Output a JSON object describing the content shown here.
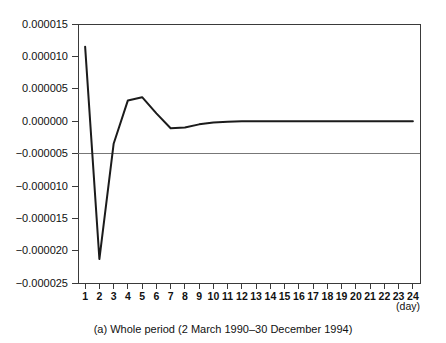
{
  "chart_data": {
    "type": "line",
    "title": "",
    "subtitle": "",
    "caption": "(a) Whole period (2 March 1990–30 December 1994)",
    "xlabel": "",
    "xunit": "(day)",
    "ylabel": "",
    "grid": false,
    "legend": false,
    "legend_position": "none",
    "xlim": [
      0.5,
      24.5
    ],
    "ylim": [
      -2.5e-05,
      1.5e-05
    ],
    "x_ticks": [
      1,
      2,
      3,
      4,
      5,
      6,
      7,
      8,
      9,
      10,
      11,
      12,
      13,
      14,
      15,
      16,
      17,
      18,
      19,
      20,
      21,
      22,
      23,
      24
    ],
    "x_tick_labels": [
      "1",
      "2",
      "3",
      "4",
      "5",
      "6",
      "7",
      "8",
      "9",
      "10",
      "11",
      "12",
      "13",
      "14",
      "15",
      "16",
      "17",
      "18",
      "19",
      "20",
      "21",
      "22",
      "23",
      "24"
    ],
    "y_ticks": [
      1.5e-05,
      1e-05,
      5e-06,
      0.0,
      -5e-06,
      -1e-05,
      -1.5e-05,
      -2e-05,
      -2.5e-05
    ],
    "y_tick_labels": [
      "0.000015",
      "0.000010",
      "0.000005",
      "0.000000",
      "−0.000005",
      "−0.000010",
      "−0.000015",
      "−0.000020",
      "−0.000025"
    ],
    "x": [
      1,
      2,
      3,
      4,
      5,
      6,
      7,
      8,
      9,
      10,
      11,
      12,
      13,
      14,
      15,
      16,
      17,
      18,
      19,
      20,
      21,
      22,
      23,
      24
    ],
    "values": [
      1.15e-05,
      -2.13e-05,
      -3.5e-06,
      3.2e-06,
      3.7e-06,
      1.2e-06,
      -1.1e-06,
      -1e-06,
      -5e-07,
      -2e-07,
      -1e-07,
      0.0,
      0.0,
      0.0,
      0.0,
      0.0,
      0.0,
      0.0,
      0.0,
      0.0,
      0.0,
      0.0,
      0.0,
      0.0
    ],
    "series": [
      {
        "name": "impulse-response",
        "color": "#1b1b1b",
        "values": [
          1.15e-05,
          -2.13e-05,
          -3.5e-06,
          3.2e-06,
          3.7e-06,
          1.2e-06,
          -1.1e-06,
          -1e-06,
          -5e-07,
          -2e-07,
          -1e-07,
          0.0,
          0.0,
          0.0,
          0.0,
          0.0,
          0.0,
          0.0,
          0.0,
          0.0,
          0.0,
          0.0,
          0.0,
          0.0
        ]
      }
    ],
    "zero_reference_line": 0.0,
    "colors": {
      "series": "#1b1b1b",
      "axis": "#3a3a3a",
      "zero_line": "#777777",
      "background": "#ffffff",
      "text": "#111111"
    }
  }
}
